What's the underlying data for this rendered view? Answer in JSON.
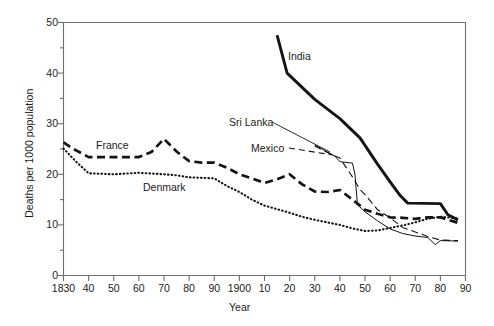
{
  "figure": {
    "background_color": "#ffffff",
    "line_color": "#141414",
    "axis_color": "#6e6e6e"
  },
  "axes": {
    "y_title": "Deaths per 1000 population",
    "x_title": "Year",
    "y_ticks_major": [
      {
        "value": 0,
        "label": "0"
      },
      {
        "value": 10,
        "label": "10"
      },
      {
        "value": 20,
        "label": "20"
      },
      {
        "value": 30,
        "label": "30"
      },
      {
        "value": 40,
        "label": "40"
      },
      {
        "value": 50,
        "label": "50"
      }
    ],
    "y_ticks_minor": [
      5,
      15,
      25,
      35,
      45
    ],
    "x_ticks": [
      {
        "value": 1830,
        "label": "1830"
      },
      {
        "value": 1840,
        "label": "40"
      },
      {
        "value": 1850,
        "label": "50"
      },
      {
        "value": 1860,
        "label": "60"
      },
      {
        "value": 1870,
        "label": "70"
      },
      {
        "value": 1880,
        "label": "80"
      },
      {
        "value": 1890,
        "label": "90"
      },
      {
        "value": 1900,
        "label": "1900"
      },
      {
        "value": 1910,
        "label": "10"
      },
      {
        "value": 1920,
        "label": "20"
      },
      {
        "value": 1930,
        "label": "30"
      },
      {
        "value": 1940,
        "label": "40"
      },
      {
        "value": 1950,
        "label": "50"
      },
      {
        "value": 1960,
        "label": "60"
      },
      {
        "value": 1970,
        "label": "70"
      },
      {
        "value": 1980,
        "label": "80"
      },
      {
        "value": 1990,
        "label": "90"
      }
    ]
  },
  "series_labels": {
    "france": "France",
    "denmark": "Denmark",
    "india": "India",
    "sri_lanka": "Sri Lanka",
    "mexico": "Mexico"
  },
  "chart_data": {
    "type": "line",
    "title": "",
    "xlabel": "Year",
    "ylabel": "Deaths per 1000 population",
    "xlim": [
      1830,
      1990
    ],
    "ylim": [
      0,
      50
    ],
    "grid": false,
    "legend_position": "inline-annotations",
    "series": [
      {
        "name": "France",
        "style": "dashed-thick",
        "label_annotation": "France",
        "points": [
          [
            1830,
            26.3
          ],
          [
            1834,
            25.0
          ],
          [
            1840,
            23.4
          ],
          [
            1850,
            23.4
          ],
          [
            1860,
            23.4
          ],
          [
            1865,
            24.4
          ],
          [
            1870,
            27.0
          ],
          [
            1875,
            24.5
          ],
          [
            1880,
            22.6
          ],
          [
            1885,
            22.3
          ],
          [
            1890,
            22.3
          ],
          [
            1895,
            21.3
          ],
          [
            1900,
            20.0
          ],
          [
            1905,
            19.2
          ],
          [
            1910,
            18.3
          ],
          [
            1915,
            19.0
          ],
          [
            1920,
            20.0
          ],
          [
            1925,
            18.0
          ],
          [
            1930,
            16.6
          ],
          [
            1935,
            16.5
          ],
          [
            1940,
            16.9
          ],
          [
            1945,
            15.0
          ],
          [
            1950,
            13.0
          ],
          [
            1955,
            12.2
          ],
          [
            1960,
            11.5
          ],
          [
            1965,
            11.4
          ],
          [
            1970,
            11.2
          ],
          [
            1975,
            11.5
          ],
          [
            1980,
            11.5
          ],
          [
            1987,
            10.4
          ]
        ]
      },
      {
        "name": "Denmark",
        "style": "dotted",
        "label_annotation": "Denmark",
        "points": [
          [
            1830,
            25.1
          ],
          [
            1835,
            22.5
          ],
          [
            1840,
            20.2
          ],
          [
            1850,
            20.0
          ],
          [
            1860,
            20.3
          ],
          [
            1870,
            20.0
          ],
          [
            1875,
            19.8
          ],
          [
            1880,
            19.4
          ],
          [
            1885,
            19.3
          ],
          [
            1890,
            19.2
          ],
          [
            1895,
            17.7
          ],
          [
            1900,
            16.5
          ],
          [
            1905,
            15.0
          ],
          [
            1910,
            13.8
          ],
          [
            1915,
            13.1
          ],
          [
            1920,
            12.4
          ],
          [
            1925,
            11.6
          ],
          [
            1930,
            11.0
          ],
          [
            1935,
            10.5
          ],
          [
            1940,
            10.0
          ],
          [
            1945,
            9.3
          ],
          [
            1950,
            8.8
          ],
          [
            1955,
            8.9
          ],
          [
            1960,
            9.4
          ],
          [
            1965,
            9.9
          ],
          [
            1970,
            10.5
          ],
          [
            1975,
            11.2
          ],
          [
            1980,
            11.6
          ],
          [
            1987,
            11.3
          ]
        ]
      },
      {
        "name": "India",
        "style": "solid-thick",
        "label_annotation": "India",
        "points": [
          [
            1915,
            47.5
          ],
          [
            1919,
            40.0
          ],
          [
            1930,
            34.8
          ],
          [
            1940,
            31.0
          ],
          [
            1948,
            27.2
          ],
          [
            1955,
            22.0
          ],
          [
            1960,
            18.5
          ],
          [
            1964,
            15.8
          ],
          [
            1967,
            14.3
          ],
          [
            1980,
            14.2
          ],
          [
            1983,
            12.0
          ],
          [
            1987,
            11.0
          ]
        ]
      },
      {
        "name": "Sri Lanka",
        "style": "solid-thin",
        "label_annotation": "Sri Lanka",
        "points": [
          [
            1930,
            25.8
          ],
          [
            1938,
            23.6
          ],
          [
            1940,
            22.5
          ],
          [
            1945,
            22.2
          ],
          [
            1946,
            20.0
          ],
          [
            1947,
            14.0
          ],
          [
            1950,
            12.6
          ],
          [
            1955,
            10.8
          ],
          [
            1960,
            9.2
          ],
          [
            1965,
            8.3
          ],
          [
            1970,
            7.8
          ],
          [
            1975,
            7.5
          ],
          [
            1978,
            6.1
          ],
          [
            1980,
            6.9
          ],
          [
            1987,
            6.8
          ]
        ]
      },
      {
        "name": "Mexico",
        "style": "dashed-thin",
        "label_annotation": "Mexico",
        "points": [
          [
            1930,
            25.6
          ],
          [
            1935,
            24.3
          ],
          [
            1940,
            23.2
          ],
          [
            1945,
            19.5
          ],
          [
            1948,
            17.0
          ],
          [
            1950,
            16.0
          ],
          [
            1955,
            13.0
          ],
          [
            1960,
            11.4
          ],
          [
            1965,
            9.5
          ],
          [
            1970,
            8.6
          ],
          [
            1975,
            7.7
          ],
          [
            1980,
            7.0
          ],
          [
            1987,
            6.9
          ]
        ]
      }
    ],
    "annotation_leaders": [
      {
        "from_label": "Sri Lanka",
        "note": "thin solid leader to Sri Lanka curve"
      },
      {
        "from_label": "Mexico",
        "note": "thin dashed leader to Mexico curve"
      }
    ]
  }
}
